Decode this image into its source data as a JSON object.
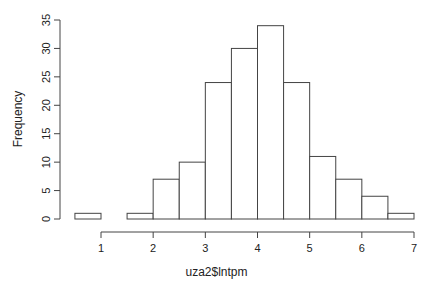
{
  "chart_data": {
    "type": "bar",
    "subtype": "histogram",
    "title": "",
    "xlabel": "uza2$lntpm",
    "ylabel": "Frequency",
    "bin_edges": [
      0.5,
      1.0,
      1.5,
      2.0,
      2.5,
      3.0,
      3.5,
      4.0,
      4.5,
      5.0,
      5.5,
      6.0,
      6.5,
      7.0
    ],
    "categories": [
      "0.5-1",
      "1-1.5",
      "1.5-2",
      "2-2.5",
      "2.5-3",
      "3-3.5",
      "3.5-4",
      "4-4.5",
      "4.5-5",
      "5-5.5",
      "5.5-6",
      "6-6.5",
      "6.5-7"
    ],
    "values": [
      1,
      0,
      1,
      7,
      10,
      24,
      30,
      34,
      24,
      11,
      7,
      4,
      1
    ],
    "xticks": [
      1,
      2,
      3,
      4,
      5,
      6,
      7
    ],
    "yticks": [
      0,
      5,
      10,
      15,
      20,
      25,
      30,
      35
    ],
    "xlim": [
      0.5,
      7
    ],
    "ylim": [
      0,
      35
    ],
    "grid": false,
    "legend": null
  }
}
